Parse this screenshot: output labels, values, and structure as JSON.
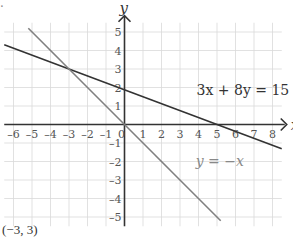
{
  "chart_data": {
    "type": "line",
    "title": "",
    "xlabel": "x",
    "ylabel": "y",
    "xlim": [
      -6.5,
      8.5
    ],
    "ylim": [
      -5.5,
      5.5
    ],
    "grid": true,
    "x_ticks": [
      -6,
      -5,
      -4,
      -3,
      -2,
      -1,
      0,
      1,
      2,
      3,
      4,
      5,
      6,
      7,
      8
    ],
    "y_ticks": [
      -5,
      -4,
      -3,
      -2,
      -1,
      1,
      2,
      3,
      4,
      5
    ],
    "series": [
      {
        "name": "3x + 8y = 15",
        "color": "#333333",
        "equation": "y = (15 - 3x)/8",
        "x": [
          -6.5,
          8.5
        ],
        "y": [
          4.3125,
          -1.3125
        ]
      },
      {
        "name": "y = −x",
        "color": "#808080",
        "equation": "y = -x",
        "x": [
          -5.2,
          5.2
        ],
        "y": [
          5.2,
          -5.2
        ]
      }
    ],
    "annotations": [
      {
        "text": "3x + 8y = 15",
        "x": 3.3,
        "y": 1.8
      },
      {
        "text": "y = −x",
        "x": 3.2,
        "y": -2.1
      }
    ],
    "intersection": {
      "x": -3,
      "y": 3,
      "label": "(−3, 3)"
    }
  },
  "labels": {
    "x_axis": "x",
    "y_axis": "y",
    "line1": "3x + 8y = 15",
    "line2": "y = −x",
    "answer": "(−3, 3)"
  }
}
